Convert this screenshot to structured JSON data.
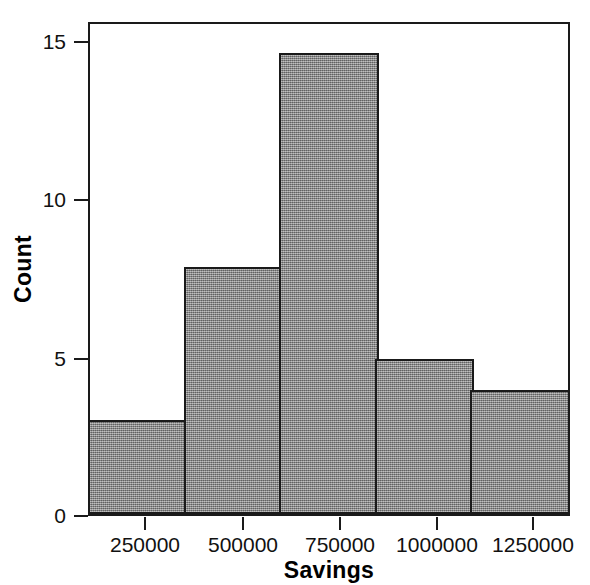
{
  "chart_data": {
    "type": "bar",
    "chart_subtype": "histogram",
    "title": "",
    "xlabel": "Savings",
    "ylabel": "Count",
    "categories": [
      "100000-350000",
      "350000-600000",
      "600000-850000",
      "850000-1100000",
      "1100000-1350000"
    ],
    "bin_edges": [
      100000,
      350000,
      600000,
      850000,
      1100000,
      1350000
    ],
    "bin_width": 250000,
    "values": [
      3,
      8,
      15,
      5,
      4
    ],
    "bars": [
      {
        "label": "bin-1",
        "value": 3,
        "left": 100000,
        "right": 350000
      },
      {
        "label": "bin-2",
        "value": 8,
        "left": 350000,
        "right": 600000
      },
      {
        "label": "bin-3",
        "value": 15,
        "left": 600000,
        "right": 850000
      },
      {
        "label": "bin-4",
        "value": 5,
        "left": 850000,
        "right": 1100000
      },
      {
        "label": "bin-5",
        "value": 4,
        "left": 1100000,
        "right": 1350000
      }
    ],
    "total_count": 35,
    "xlim": [
      100000,
      1350000
    ],
    "ylim": [
      0,
      16
    ],
    "y_ticks": [
      0,
      5,
      10,
      15
    ],
    "y_tick_labels": [
      "0",
      "5",
      "10",
      "15"
    ],
    "x_ticks": [
      250000,
      500000,
      750000,
      1000000,
      1250000
    ],
    "x_tick_labels": [
      "250000",
      "500000",
      "750000",
      "1000000",
      "1250000"
    ],
    "grid": false,
    "legend": false,
    "legend_position": "none",
    "bar_fill_color": "#8a8a8a",
    "bar_edge_color": "#1a1a1a",
    "axis_color": "#1a1a1a",
    "background_color": "#ffffff"
  }
}
